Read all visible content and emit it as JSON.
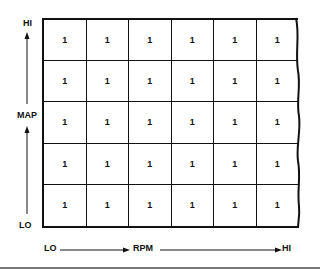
{
  "diagram": {
    "y_axis": {
      "label": "MAP",
      "high": "HI",
      "low": "LO"
    },
    "x_axis": {
      "label": "RPM",
      "low": "LO",
      "high": "HI"
    },
    "grid": {
      "rows": [
        [
          "1",
          "1",
          "1",
          "1",
          "1",
          "1"
        ],
        [
          "1",
          "1",
          "1",
          "1",
          "1",
          "1"
        ],
        [
          "1",
          "1",
          "1",
          "1",
          "1",
          "1"
        ],
        [
          "1",
          "1",
          "1",
          "1",
          "1",
          "1"
        ],
        [
          "1",
          "1",
          "1",
          "1",
          "1",
          "1"
        ]
      ]
    }
  }
}
